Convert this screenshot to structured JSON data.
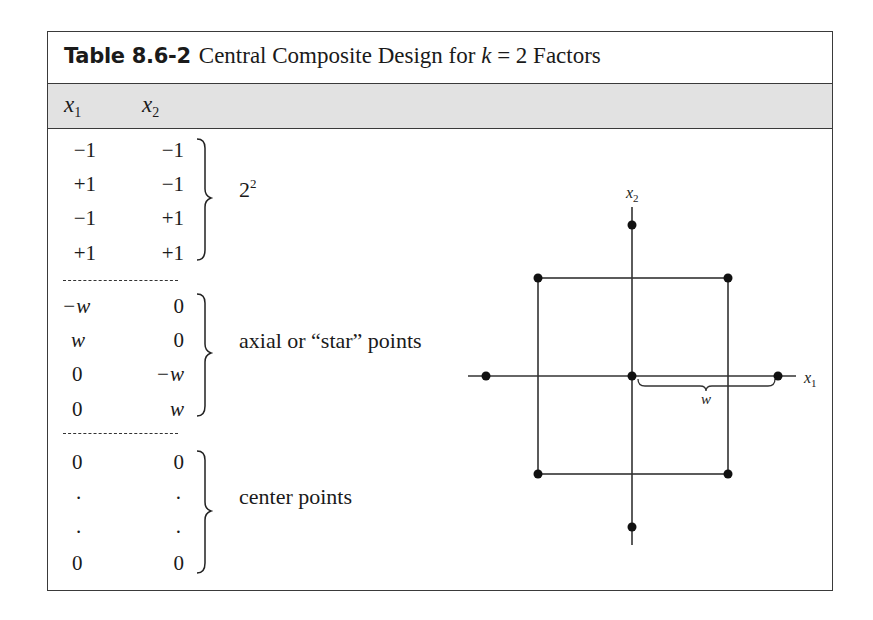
{
  "table": {
    "label": "Table 8.6-2",
    "title_prefix": "Central Composite Design for ",
    "title_var": "k",
    "title_suffix": " = 2 Factors",
    "columns": [
      {
        "name": "x",
        "sub": "1"
      },
      {
        "name": "x",
        "sub": "2"
      }
    ],
    "groups": [
      {
        "label": "2",
        "label_sup": "2",
        "rows": [
          [
            "−1",
            "−1"
          ],
          [
            "+1",
            "−1"
          ],
          [
            "−1",
            "+1"
          ],
          [
            "+1",
            "+1"
          ]
        ]
      },
      {
        "label": "axial or “star” points",
        "rows": [
          [
            "−w",
            "0"
          ],
          [
            "w",
            "0"
          ],
          [
            "0",
            "−w"
          ],
          [
            "0",
            "w"
          ]
        ]
      },
      {
        "label": "center points",
        "rows": [
          [
            "0",
            "0"
          ],
          [
            ".",
            "."
          ],
          [
            ".",
            "."
          ],
          [
            "0",
            "0"
          ]
        ]
      }
    ]
  },
  "diagram": {
    "x_axis_label": "x",
    "x_axis_sub": "1",
    "y_axis_label": "x",
    "y_axis_sub": "2",
    "distance_label": "w",
    "colors": {
      "line": "#333333",
      "point": "#111111",
      "header_bg": "#e2e2e2"
    },
    "points": {
      "factorial": [
        [
          -1,
          1
        ],
        [
          1,
          1
        ],
        [
          -1,
          -1
        ],
        [
          1,
          -1
        ]
      ],
      "axial": [
        [
          -1.414,
          0
        ],
        [
          1.414,
          0
        ],
        [
          0,
          1.414
        ],
        [
          0,
          -1.414
        ]
      ],
      "center": [
        [
          0,
          0
        ]
      ]
    }
  }
}
